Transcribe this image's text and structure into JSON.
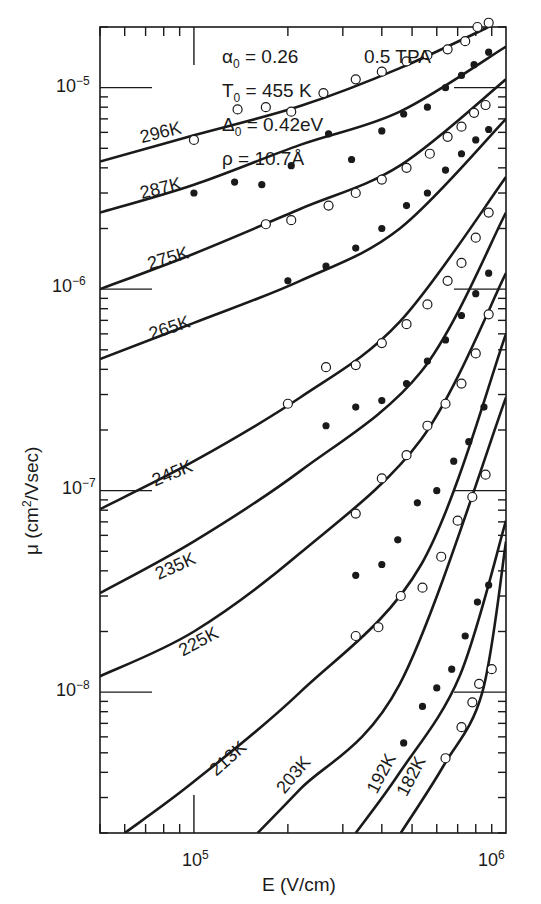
{
  "chart_data": {
    "type": "line",
    "title": "",
    "xlabel": "E (V/cm)",
    "ylabel": "μ (cm²/Vsec)",
    "xscale": "log",
    "yscale": "log",
    "xlim": [
      50000,
      1000000
    ],
    "ylim": [
      2e-09,
      2e-05
    ],
    "x_ticks": [
      {
        "value": 100000,
        "label": "10^5"
      },
      {
        "value": 1000000,
        "label": "10^6"
      }
    ],
    "y_ticks": [
      {
        "value": 1e-05,
        "label": "10^-5"
      },
      {
        "value": 1e-06,
        "label": "10^-6"
      },
      {
        "value": 1e-07,
        "label": "10^-7"
      },
      {
        "value": 1e-08,
        "label": "10^-8"
      }
    ],
    "grid": false,
    "annotations": {
      "alpha0": "α₀ = 0.26",
      "T0": "T₀ = 455 K",
      "Delta0": "Δ₀ = 0.42 eV",
      "rho": "ρ = 10.7 Å",
      "sample": "0.5 TPA"
    },
    "series": [
      {
        "name": "296K",
        "marker": "open",
        "curve": [
          [
            50000,
            4.3e-06
          ],
          [
            100000,
            5.8e-06
          ],
          [
            219000,
            8.1e-06
          ],
          [
            457000,
            1.25e-05
          ],
          [
            1000000,
            2.2e-05
          ]
        ],
        "points": [
          [
            100000,
            5.5e-06
          ],
          [
            138000,
            7.8e-06
          ],
          [
            170000,
            8e-06
          ],
          [
            205000,
            7.6e-06
          ],
          [
            260000,
            9.4e-06
          ],
          [
            330000,
            1.1e-05
          ],
          [
            400000,
            1.2e-05
          ],
          [
            480000,
            1.35e-05
          ],
          [
            560000,
            1.45e-05
          ],
          [
            650000,
            1.55e-05
          ],
          [
            740000,
            1.7e-05
          ],
          [
            810000,
            2e-05
          ],
          [
            880000,
            2.1e-05
          ]
        ]
      },
      {
        "name": "287K",
        "marker": "filled",
        "curve": [
          [
            50000,
            2.4e-06
          ],
          [
            100000,
            3.3e-06
          ],
          [
            219000,
            5.2e-06
          ],
          [
            457000,
            7.6e-06
          ],
          [
            1000000,
            1.6e-05
          ]
        ],
        "points": [
          [
            100000,
            3e-06
          ],
          [
            135000,
            3.4e-06
          ],
          [
            165000,
            3.3e-06
          ],
          [
            205000,
            4.1e-06
          ],
          [
            270000,
            5.9e-06
          ],
          [
            320000,
            4.4e-06
          ],
          [
            400000,
            6.1e-06
          ],
          [
            470000,
            7.4e-06
          ],
          [
            560000,
            8e-06
          ],
          [
            640000,
            1e-05
          ],
          [
            720000,
            1.15e-05
          ],
          [
            790000,
            1.3e-05
          ],
          [
            880000,
            1.5e-05
          ]
        ]
      },
      {
        "name": "275K",
        "marker": "open",
        "curve": [
          [
            50000,
            1e-06
          ],
          [
            100000,
            1.5e-06
          ],
          [
            219000,
            2.5e-06
          ],
          [
            457000,
            4.1e-06
          ],
          [
            1000000,
            1.1e-05
          ]
        ],
        "points": [
          [
            170000,
            2.1e-06
          ],
          [
            205000,
            2.2e-06
          ],
          [
            270000,
            2.6e-06
          ],
          [
            330000,
            3e-06
          ],
          [
            400000,
            3.5e-06
          ],
          [
            480000,
            4e-06
          ],
          [
            570000,
            4.7e-06
          ],
          [
            650000,
            5.7e-06
          ],
          [
            720000,
            6.4e-06
          ],
          [
            790000,
            7.5e-06
          ],
          [
            860000,
            8.2e-06
          ]
        ]
      },
      {
        "name": "265K",
        "marker": "filled",
        "curve": [
          [
            50000,
            4.5e-07
          ],
          [
            100000,
            6.8e-07
          ],
          [
            219000,
            1.1e-06
          ],
          [
            457000,
            2e-06
          ],
          [
            1000000,
            7e-06
          ]
        ],
        "points": [
          [
            200000,
            1.1e-06
          ],
          [
            265000,
            1.3e-06
          ],
          [
            330000,
            1.6e-06
          ],
          [
            400000,
            2e-06
          ],
          [
            480000,
            2.6e-06
          ],
          [
            560000,
            3e-06
          ],
          [
            640000,
            3.9e-06
          ],
          [
            720000,
            4.7e-06
          ],
          [
            800000,
            5.5e-06
          ],
          [
            880000,
            6.2e-06
          ]
        ]
      },
      {
        "name": "245K",
        "marker": "open",
        "curve": [
          [
            50000,
            8.1e-08
          ],
          [
            100000,
            1.4e-07
          ],
          [
            219000,
            2.9e-07
          ],
          [
            457000,
            6.9e-07
          ],
          [
            1000000,
            3.6e-06
          ]
        ],
        "points": [
          [
            200000,
            2.7e-07
          ],
          [
            265000,
            4.1e-07
          ],
          [
            330000,
            4.2e-07
          ],
          [
            400000,
            5.4e-07
          ],
          [
            480000,
            6.7e-07
          ],
          [
            560000,
            8.4e-07
          ],
          [
            650000,
            1.1e-06
          ],
          [
            720000,
            1.35e-06
          ],
          [
            800000,
            1.8e-06
          ],
          [
            880000,
            2.4e-06
          ]
        ]
      },
      {
        "name": "235K",
        "marker": "filled",
        "curve": [
          [
            50000,
            3.1e-08
          ],
          [
            100000,
            5.6e-08
          ],
          [
            219000,
            1.25e-07
          ],
          [
            535000,
            3.9e-07
          ],
          [
            1000000,
            2.4e-06
          ]
        ],
        "points": [
          [
            265000,
            2.1e-07
          ],
          [
            330000,
            2.6e-07
          ],
          [
            400000,
            2.8e-07
          ],
          [
            480000,
            3.4e-07
          ],
          [
            560000,
            4.4e-07
          ],
          [
            640000,
            5.6e-07
          ],
          [
            720000,
            7.4e-07
          ],
          [
            800000,
            9.5e-07
          ],
          [
            880000,
            1.2e-06
          ]
        ]
      },
      {
        "name": "225K",
        "marker": "open",
        "curve": [
          [
            50000,
            1.2e-08
          ],
          [
            100000,
            2e-08
          ],
          [
            219000,
            4.9e-08
          ],
          [
            535000,
            1.8e-07
          ],
          [
            1000000,
            1.2e-06
          ]
        ],
        "points": [
          [
            330000,
            7.7e-08
          ],
          [
            400000,
            1.15e-07
          ],
          [
            480000,
            1.5e-07
          ],
          [
            560000,
            2.1e-07
          ],
          [
            640000,
            2.7e-07
          ],
          [
            720000,
            3.4e-07
          ],
          [
            800000,
            4.8e-07
          ],
          [
            880000,
            7.5e-07
          ]
        ]
      },
      {
        "name": "213K",
        "marker": "filled",
        "curve": [
          [
            60000,
            2e-09
          ],
          [
            100000,
            3.6e-09
          ],
          [
            219000,
            1e-08
          ],
          [
            535000,
            4.3e-08
          ],
          [
            1000000,
            6e-07
          ]
        ],
        "points": [
          [
            330000,
            3.8e-08
          ],
          [
            400000,
            4.3e-08
          ],
          [
            450000,
            5.7e-08
          ],
          [
            520000,
            8.7e-08
          ],
          [
            600000,
            1e-07
          ],
          [
            680000,
            1.4e-07
          ],
          [
            760000,
            1.75e-07
          ],
          [
            850000,
            2.6e-07
          ]
        ]
      },
      {
        "name": "203K",
        "marker": "open",
        "curve": [
          [
            160000,
            2e-09
          ],
          [
            219000,
            3.3e-09
          ],
          [
            457000,
            1.1e-08
          ],
          [
            1000000,
            2.9e-07
          ]
        ],
        "points": [
          [
            330000,
            1.9e-08
          ],
          [
            390000,
            2.1e-08
          ],
          [
            460000,
            3e-08
          ],
          [
            540000,
            3.3e-08
          ],
          [
            620000,
            4.7e-08
          ],
          [
            700000,
            7.1e-08
          ],
          [
            780000,
            9.3e-08
          ],
          [
            860000,
            1.2e-07
          ]
        ]
      },
      {
        "name": "192K",
        "marker": "filled",
        "curve": [
          [
            330000,
            2e-09
          ],
          [
            457000,
            4e-09
          ],
          [
            710000,
            1.2e-08
          ],
          [
            1000000,
            7.1e-08
          ]
        ],
        "points": [
          [
            470000,
            5.6e-09
          ],
          [
            540000,
            8.5e-09
          ],
          [
            600000,
            1.05e-08
          ],
          [
            670000,
            1.3e-08
          ],
          [
            740000,
            1.9e-08
          ],
          [
            810000,
            2.8e-08
          ],
          [
            880000,
            3.4e-08
          ]
        ]
      },
      {
        "name": "182K",
        "marker": "open",
        "curve": [
          [
            460000,
            2e-09
          ],
          [
            630000,
            4.3e-09
          ],
          [
            840000,
            1e-08
          ],
          [
            1000000,
            5.6e-08
          ]
        ],
        "points": [
          [
            640000,
            4.7e-09
          ],
          [
            720000,
            6.7e-09
          ],
          [
            780000,
            8.9e-09
          ],
          [
            820000,
            1.1e-08
          ],
          [
            900000,
            1.3e-08
          ]
        ]
      }
    ],
    "curve_labels": [
      {
        "series": "296K",
        "x": 68000,
        "y": 5.3e-06,
        "angle": -14
      },
      {
        "series": "287K",
        "x": 68000,
        "y": 2.8e-06,
        "angle": -14
      },
      {
        "series": "275K",
        "x": 72000,
        "y": 1.25e-06,
        "angle": -16
      },
      {
        "series": "265K",
        "x": 73000,
        "y": 5.6e-07,
        "angle": -18
      },
      {
        "series": "245K",
        "x": 75000,
        "y": 1.05e-07,
        "angle": -22
      },
      {
        "series": "235K",
        "x": 77000,
        "y": 3.6e-08,
        "angle": -24
      },
      {
        "series": "225K",
        "x": 92000,
        "y": 1.5e-08,
        "angle": -28
      },
      {
        "series": "213K",
        "x": 118000,
        "y": 3.8e-09,
        "angle": -42
      },
      {
        "series": "203K",
        "x": 195000,
        "y": 3.1e-09,
        "angle": -50
      },
      {
        "series": "192K",
        "x": 385000,
        "y": 3.1e-09,
        "angle": -62
      },
      {
        "series": "182K",
        "x": 480000,
        "y": 3e-09,
        "angle": -62
      }
    ]
  },
  "labels": {
    "param_alpha": "α",
    "param_alpha_sub": "0",
    "param_alpha_val": " = 0.26",
    "param_T": "T",
    "param_T_sub": "0",
    "param_T_val": " = 455 K",
    "param_D": "Δ",
    "param_D_sub": "0",
    "param_D_val": " = 0.42eV",
    "param_rho": "ρ = 10.7Å",
    "sample": "0.5 TPA",
    "ytick_base": "10",
    "ytick_e5": "−5",
    "ytick_e6": "−6",
    "ytick_e7": "−7",
    "ytick_e8": "−8",
    "xtick_base": "10",
    "xtick_e5": "5",
    "xtick_e6": "6",
    "xlabel": "E (V/cm)",
    "ylabel_mu": "μ",
    "ylabel_unit": " (cm",
    "ylabel_sup": "2",
    "ylabel_end": "/Vsec)"
  }
}
